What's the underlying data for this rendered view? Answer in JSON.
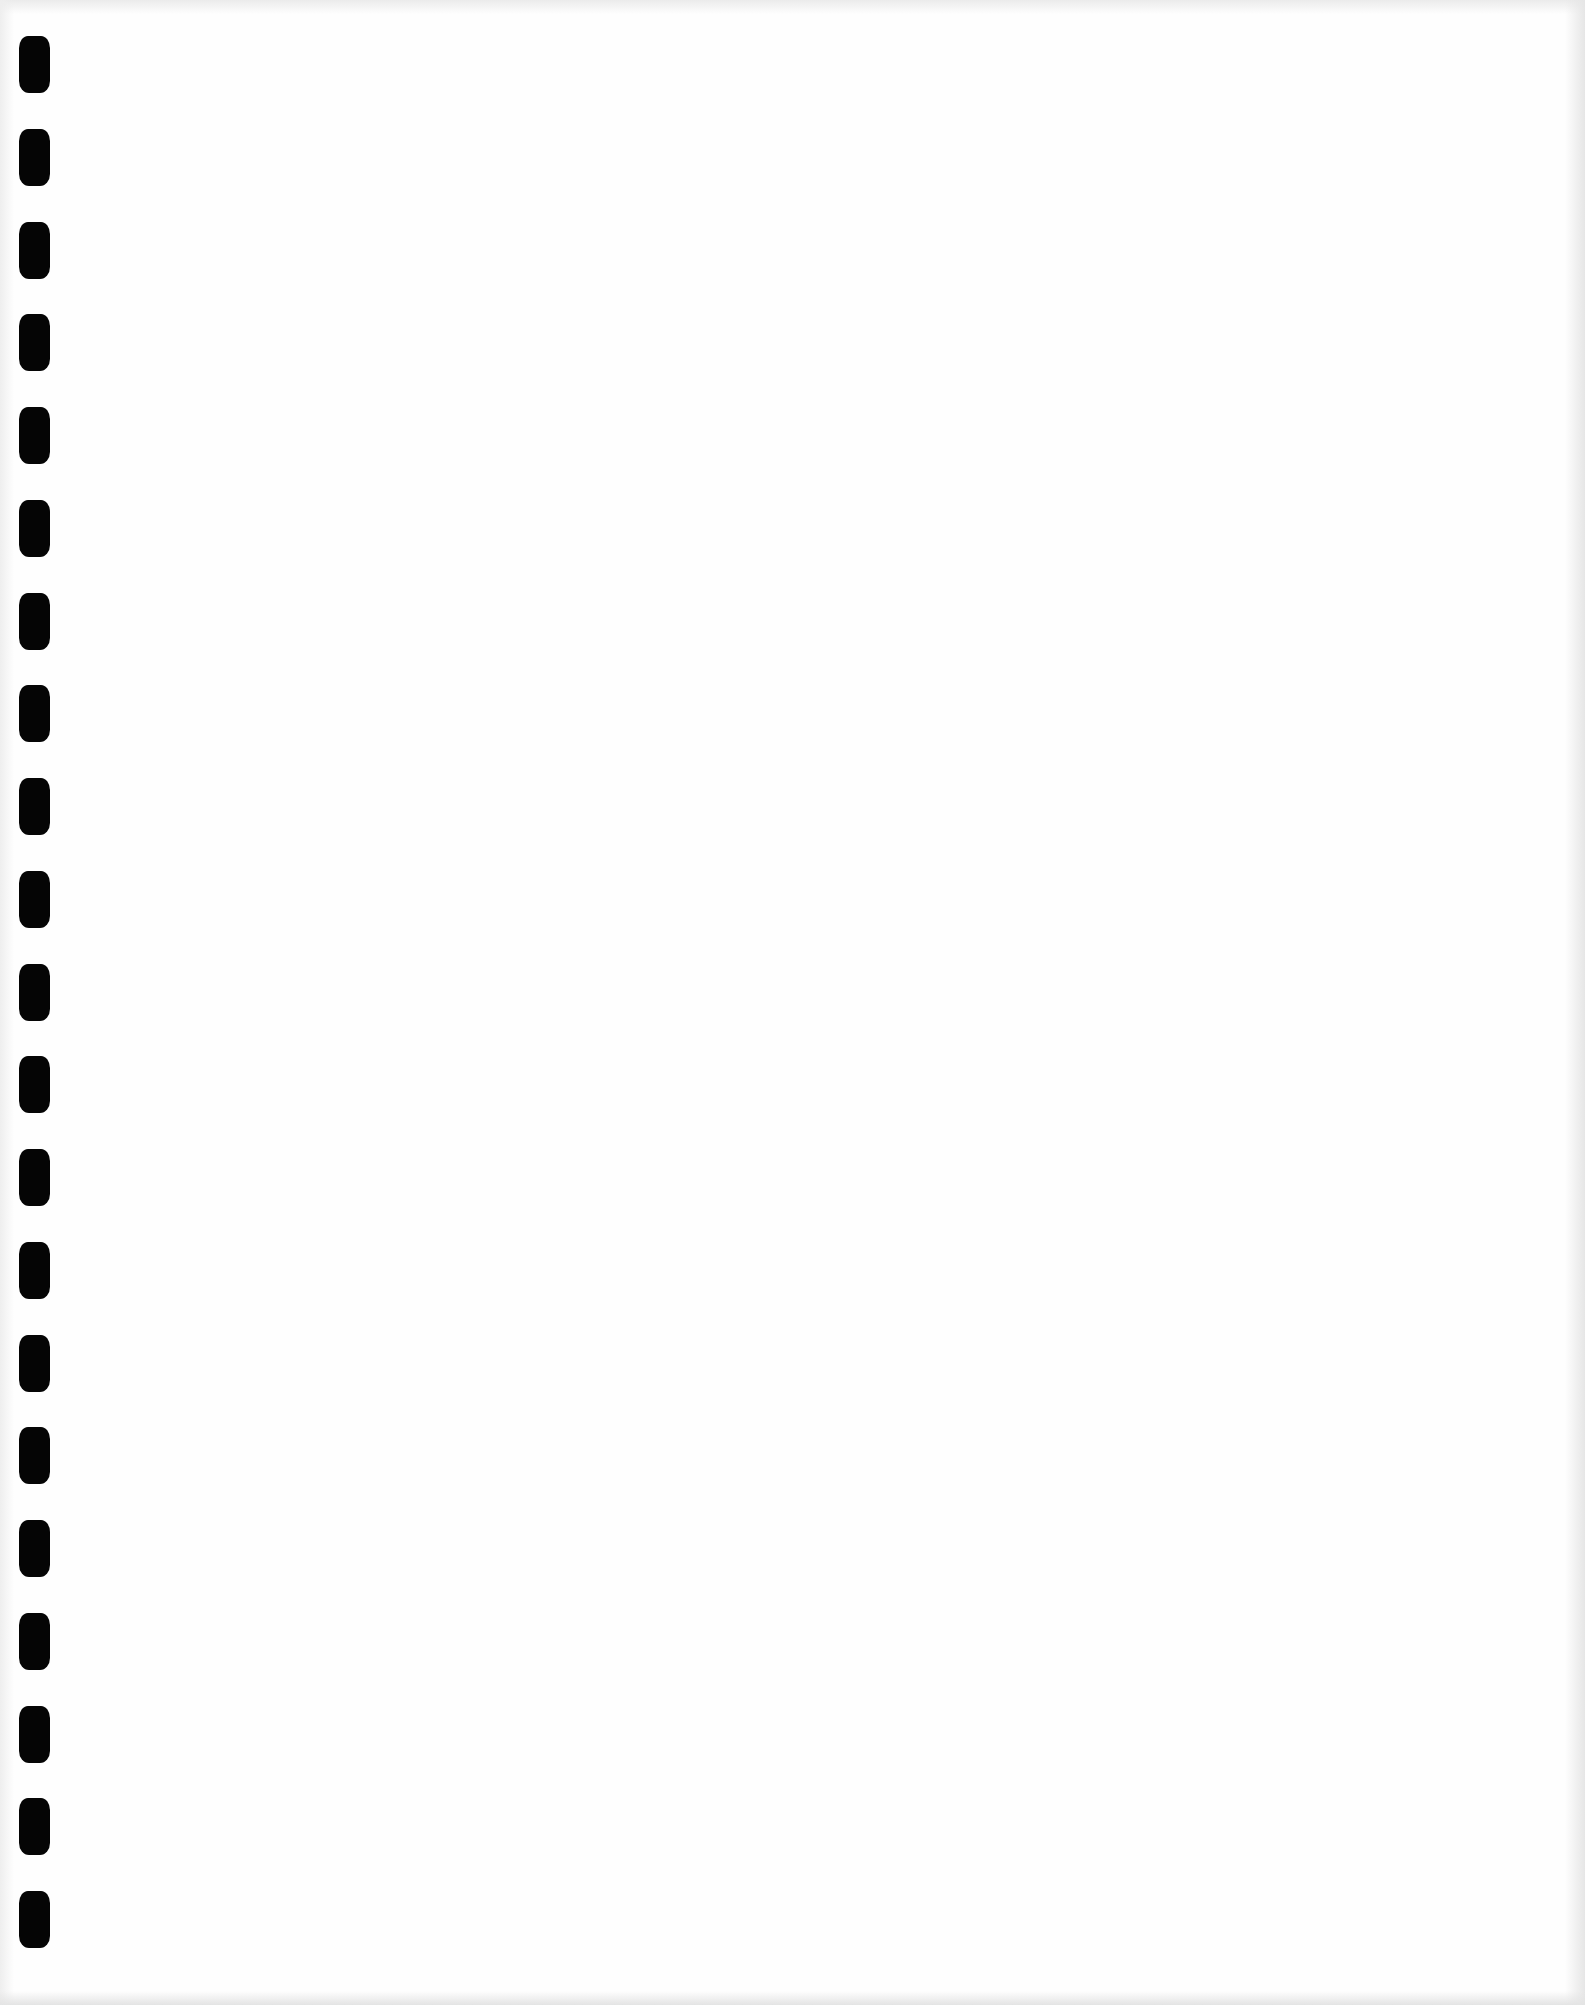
{
  "document": {
    "type": "blank scanned page",
    "text": "",
    "binding": {
      "style": "comb binding punch holes",
      "side": "left",
      "hole_count": 21,
      "hole_color": "#050505"
    },
    "colors": {
      "paper": "#fefefe",
      "edge_shadow": "#e6e6e6"
    }
  }
}
